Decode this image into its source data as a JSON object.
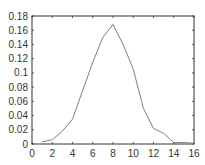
{
  "chart_data": {
    "type": "line",
    "title": "",
    "xlabel": "",
    "ylabel": "",
    "xlim": [
      0,
      16
    ],
    "ylim": [
      0,
      0.18
    ],
    "grid": false,
    "legend": null,
    "x_ticks": [
      "0",
      "2",
      "4",
      "6",
      "8",
      "10",
      "12",
      "14",
      "16"
    ],
    "y_ticks": [
      "0",
      "0.02",
      "0.04",
      "0.06",
      "0.08",
      "0.1",
      "0.12",
      "0.14",
      "0.16",
      "0.18"
    ],
    "series": [
      {
        "name": "series1",
        "color": "#808080",
        "x": [
          1,
          2,
          3,
          4,
          5,
          6,
          7,
          8,
          9,
          10,
          11,
          12,
          13,
          14,
          15,
          16
        ],
        "y": [
          0.003,
          0.006,
          0.018,
          0.035,
          0.075,
          0.115,
          0.15,
          0.168,
          0.14,
          0.105,
          0.05,
          0.022,
          0.015,
          0.002,
          0.002,
          0.001
        ]
      }
    ]
  },
  "colors": {
    "axis": "#333333",
    "line": "#808080",
    "background": "#ffffff"
  }
}
